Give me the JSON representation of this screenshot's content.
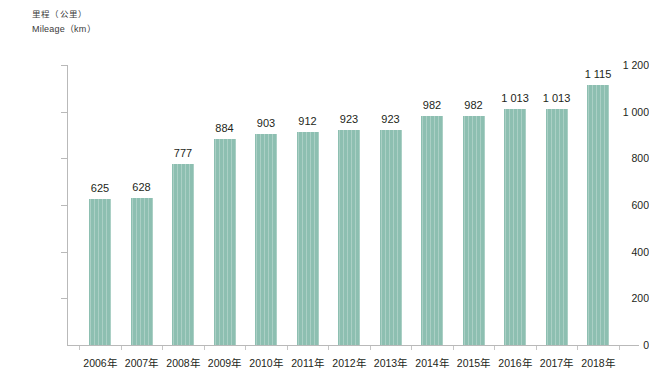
{
  "chart_data": {
    "type": "bar",
    "title": "",
    "subtitle": "",
    "ylabel_cn": "里程（公里）",
    "ylabel_en": "Mileage（km）",
    "xlabel": "",
    "categories": [
      "2006年",
      "2007年",
      "2008年",
      "2009年",
      "2010年",
      "2011年",
      "2012年",
      "2013年",
      "2014年",
      "2015年",
      "2016年",
      "2017年",
      "2018年"
    ],
    "values": [
      625,
      628,
      777,
      884,
      903,
      912,
      923,
      923,
      982,
      982,
      1013,
      1013,
      1115
    ],
    "value_labels": [
      "625",
      "628",
      "777",
      "884",
      "903",
      "912",
      "923",
      "923",
      "982",
      "982",
      "1 013",
      "1 013",
      "1 115"
    ],
    "ylim": [
      0,
      1200
    ],
    "ytick_values": [
      0,
      200,
      400,
      600,
      800,
      1000,
      1200
    ],
    "ytick_labels": [
      "0",
      "200",
      "400",
      "600",
      "800",
      "1 000",
      "1 200"
    ],
    "grid": false,
    "legend": null,
    "bar_color": "#8dbfb1",
    "axis_color": "#b9b9b9",
    "text_color": "#231f20",
    "background": "#ffffff"
  }
}
